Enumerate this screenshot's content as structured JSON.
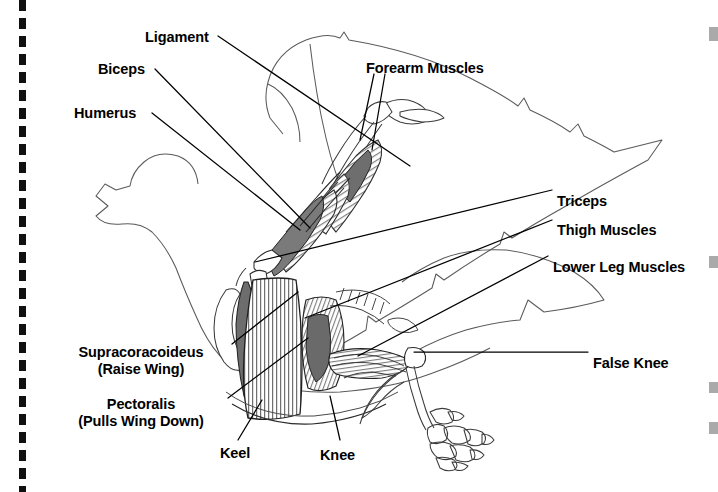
{
  "figure": {
    "background_color": "#ffffff",
    "ink_color": "#000000",
    "tear_line_color": "#101010"
  },
  "labels": [
    {
      "id": "ligament",
      "text": "Ligament",
      "x": 145,
      "y": 29,
      "align": "left"
    },
    {
      "id": "biceps",
      "text": "Biceps",
      "x": 98,
      "y": 61,
      "align": "left"
    },
    {
      "id": "humerus",
      "text": "Humerus",
      "x": 74,
      "y": 105,
      "align": "left"
    },
    {
      "id": "forearm-muscles",
      "text": "Forearm Muscles",
      "x": 366,
      "y": 60,
      "align": "left"
    },
    {
      "id": "triceps",
      "text": "Triceps",
      "x": 557,
      "y": 193,
      "align": "left"
    },
    {
      "id": "thigh-muscles",
      "text": "Thigh Muscles",
      "x": 557,
      "y": 222,
      "align": "left"
    },
    {
      "id": "lower-leg-muscles",
      "text": "Lower Leg Muscles",
      "x": 553,
      "y": 259,
      "align": "left"
    },
    {
      "id": "false-knee",
      "text": "False Knee",
      "x": 593,
      "y": 355,
      "align": "left"
    },
    {
      "id": "keel",
      "text": "Keel",
      "x": 220,
      "y": 445,
      "align": "left"
    },
    {
      "id": "knee",
      "text": "Knee",
      "x": 320,
      "y": 447,
      "align": "left"
    }
  ],
  "multiline_labels": [
    {
      "id": "supracoracoideus",
      "line1": "Supracoracoideus",
      "line2": "(Raise Wing)",
      "x": 50,
      "y": 344,
      "width": 182,
      "align": "center"
    },
    {
      "id": "pectoralis",
      "line1": "Pectoralis",
      "line2": "(Pulls Wing Down)",
      "x": 50,
      "y": 396,
      "width": 182,
      "align": "center"
    }
  ],
  "leader_lines": [
    {
      "id": "ligament-leader",
      "from": [
        218,
        36
      ],
      "to": [
        410,
        166
      ]
    },
    {
      "id": "biceps-leader",
      "from": [
        155,
        69
      ],
      "to": [
        310,
        228
      ]
    },
    {
      "id": "humerus-leader",
      "from": [
        152,
        113
      ],
      "to": [
        300,
        230
      ]
    },
    {
      "id": "forearm-leader-a",
      "from": [
        374,
        74
      ],
      "to": [
        360,
        140
      ]
    },
    {
      "id": "forearm-leader-b",
      "from": [
        385,
        74
      ],
      "to": [
        372,
        150
      ]
    },
    {
      "id": "triceps-leader",
      "from": [
        552,
        190
      ],
      "to": [
        255,
        262
      ]
    },
    {
      "id": "thigh-leader",
      "from": [
        552,
        220
      ],
      "to": [
        305,
        318
      ]
    },
    {
      "id": "lower-leg-leader",
      "from": [
        548,
        256
      ],
      "to": [
        358,
        356
      ]
    },
    {
      "id": "false-knee-leader",
      "from": [
        588,
        352
      ],
      "to": [
        414,
        352
      ]
    },
    {
      "id": "supracoracoideus-leader",
      "from": [
        232,
        344
      ],
      "to": [
        298,
        292
      ]
    },
    {
      "id": "pectoralis-leader",
      "from": [
        228,
        398
      ],
      "to": [
        308,
        338
      ]
    },
    {
      "id": "keel-leader",
      "from": [
        238,
        440
      ],
      "to": [
        262,
        400
      ]
    },
    {
      "id": "knee-leader",
      "from": [
        340,
        440
      ],
      "to": [
        330,
        396
      ]
    }
  ],
  "edge_marks": [
    {
      "id": "edge-mark-1",
      "top": 27,
      "height": 14
    },
    {
      "id": "edge-mark-2",
      "top": 256,
      "height": 12
    },
    {
      "id": "edge-mark-3",
      "top": 382,
      "height": 11
    },
    {
      "id": "edge-mark-4",
      "top": 422,
      "height": 12
    }
  ]
}
